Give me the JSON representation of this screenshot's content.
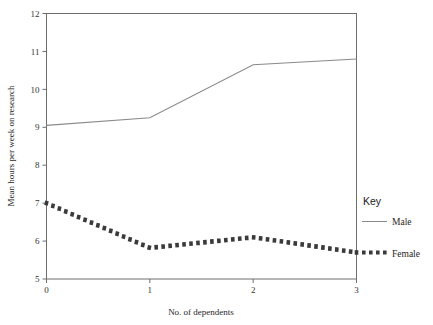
{
  "chart_data": {
    "type": "line",
    "title": "",
    "xlabel": "No. of dependents",
    "ylabel": "Mean hours per week on research",
    "xlim": [
      0,
      3
    ],
    "ylim": [
      5,
      12
    ],
    "xticks": [
      "0",
      "1",
      "2",
      "3"
    ],
    "yticks": [
      "5",
      "6",
      "7",
      "8",
      "9",
      "10",
      "11",
      "12"
    ],
    "grid": false,
    "legend_position": "right",
    "x": [
      0,
      1,
      2,
      3
    ],
    "series": [
      {
        "name": "Male",
        "style": "solid",
        "color": "#8a8a8a",
        "values": [
          9.05,
          9.25,
          10.65,
          10.8
        ]
      },
      {
        "name": "Female",
        "style": "dotted",
        "color": "#3a3a3a",
        "values": [
          7.0,
          5.82,
          6.1,
          5.7
        ]
      }
    ]
  },
  "legend": {
    "title": "Key",
    "entries": [
      {
        "label": "Male",
        "swatch": "solid-line-swatch"
      },
      {
        "label": "Female",
        "swatch": "dotted-line-swatch"
      }
    ]
  },
  "axes": {
    "x_title": "No. of dependents",
    "y_title": "Mean hours per week on research",
    "x_tick_labels": [
      "0",
      "1",
      "2",
      "3"
    ],
    "y_tick_labels": [
      "5",
      "6",
      "7",
      "8",
      "9",
      "10",
      "11",
      "12"
    ]
  },
  "colors": {
    "male_line": "#8a8a8a",
    "female_line": "#3a3a3a",
    "axis": "#6e6e6e",
    "background": "#ffffff"
  }
}
